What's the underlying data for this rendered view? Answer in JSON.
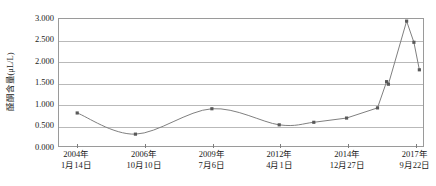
{
  "chart_data": {
    "type": "line",
    "title": "",
    "xlabel": "",
    "ylabel": "醛酮含量(μL/L)",
    "ylim": [
      0,
      3
    ],
    "ytick_labels": [
      "3.000",
      "2.500",
      "2.000",
      "1.500",
      "1.000",
      "0.500",
      "0.000"
    ],
    "ytick_values": [
      3.0,
      2.5,
      2.0,
      1.5,
      1.0,
      0.5,
      0.0
    ],
    "grid": true,
    "legend": "none",
    "marker": "square",
    "line_color": "#808080",
    "marker_color": "#595959",
    "grid_color": "#b9b9b9",
    "axis_color": "#9a9a9a",
    "xtick_labels": [
      {
        "year": "2004年",
        "day": "1月14日"
      },
      {
        "year": "2006年",
        "day": "10月10日"
      },
      {
        "year": "2009年",
        "day": "7月6日"
      },
      {
        "year": "2012年",
        "day": "4月1日"
      },
      {
        "year": "2014年",
        "day": "12月27日"
      },
      {
        "year": "2017年",
        "day": "9月22日"
      }
    ],
    "xtick_positions": [
      0.05,
      0.235,
      0.42,
      0.605,
      0.79,
      0.975
    ],
    "x": [
      0.05,
      0.21,
      0.42,
      0.605,
      0.7,
      0.79,
      0.875,
      0.9,
      0.905,
      0.955,
      0.975,
      0.99
    ],
    "values": [
      0.78,
      0.28,
      0.88,
      0.5,
      0.56,
      0.66,
      0.9,
      1.52,
      1.46,
      2.95,
      2.45,
      1.8
    ],
    "smooth_until_index": 4
  }
}
